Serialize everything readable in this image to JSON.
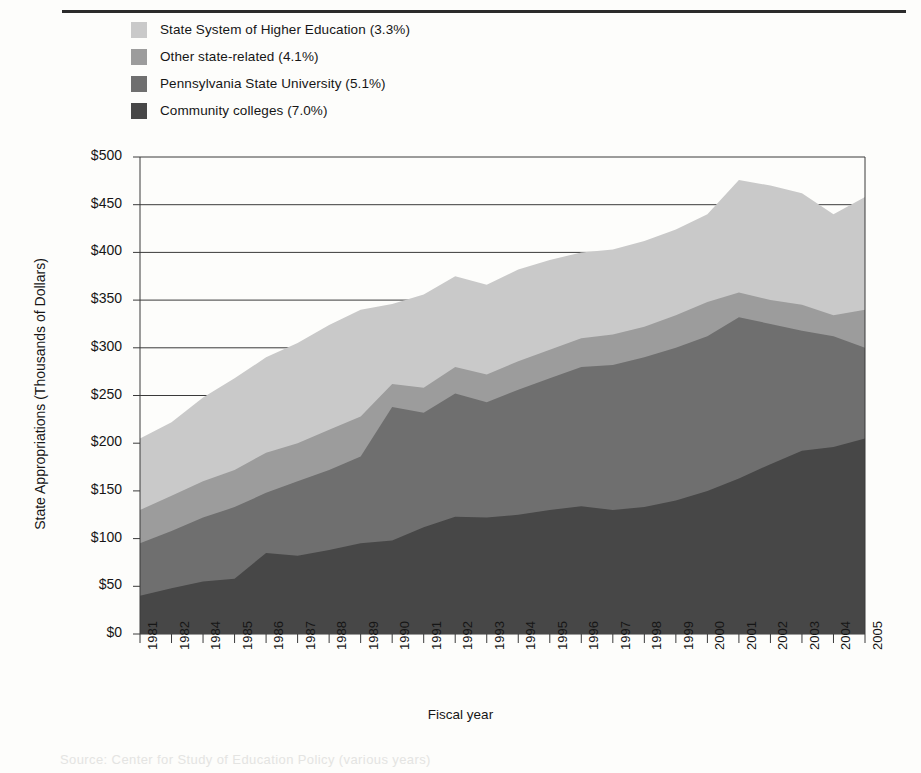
{
  "figure": {
    "caption_fragment": "Source: Center for Study of Education Policy (various years)"
  },
  "legend": {
    "position": "top-left",
    "items": [
      {
        "label": "State System of Higher Education (3.3%)",
        "color": "#c9c9c9",
        "key": "state_system"
      },
      {
        "label": "Other state-related (4.1%)",
        "color": "#9c9c9c",
        "key": "other_state_related"
      },
      {
        "label": "Pennsylvania State University (5.1%)",
        "color": "#6f6f6f",
        "key": "penn_state"
      },
      {
        "label": "Community colleges (7.0%)",
        "color": "#474747",
        "key": "community_colleges"
      }
    ]
  },
  "chart_data": {
    "type": "area",
    "stacked": true,
    "title": "",
    "xlabel": "Fiscal year",
    "ylabel": "State Appropriations (Thousands of Dollars)",
    "grid": true,
    "ylim": [
      0,
      500
    ],
    "yticks": [
      0,
      50,
      100,
      150,
      200,
      250,
      300,
      350,
      400,
      450,
      500
    ],
    "ytick_labels": [
      "$0",
      "$50",
      "$100",
      "$150",
      "$200",
      "$250",
      "$300",
      "$350",
      "$400",
      "$450",
      "$500"
    ],
    "categories": [
      "1981",
      "1982",
      "1984",
      "1985",
      "1986",
      "1987",
      "1988",
      "1989",
      "1990",
      "1991",
      "1992",
      "1993",
      "1994",
      "1995",
      "1996",
      "1997",
      "1998",
      "1999",
      "2000",
      "2001",
      "2002",
      "2003",
      "2004",
      "2005"
    ],
    "series": [
      {
        "name": "Community colleges (7.0%)",
        "color": "#474747",
        "values": [
          40,
          48,
          55,
          58,
          85,
          82,
          88,
          95,
          98,
          112,
          123,
          122,
          125,
          130,
          134,
          130,
          133,
          140,
          150,
          163,
          178,
          192,
          196,
          205
        ]
      },
      {
        "name": "Pennsylvania State University (5.1%)",
        "color": "#6f6f6f",
        "values": [
          95,
          108,
          122,
          133,
          148,
          160,
          172,
          186,
          238,
          232,
          252,
          243,
          256,
          268,
          280,
          282,
          290,
          300,
          312,
          332,
          325,
          318,
          312,
          300
        ]
      },
      {
        "name": "Other state-related (4.1%)",
        "color": "#9c9c9c",
        "values": [
          130,
          145,
          160,
          172,
          190,
          200,
          214,
          228,
          262,
          258,
          280,
          272,
          286,
          298,
          310,
          314,
          322,
          334,
          348,
          358,
          350,
          345,
          334,
          340
        ]
      },
      {
        "name": "State System of Higher Education (3.3%)",
        "color": "#c9c9c9",
        "values": [
          205,
          222,
          248,
          268,
          290,
          305,
          324,
          340,
          346,
          356,
          375,
          366,
          382,
          392,
          400,
          403,
          412,
          424,
          440,
          476,
          470,
          462,
          440,
          458
        ]
      }
    ],
    "series_are_cumulative": true
  }
}
